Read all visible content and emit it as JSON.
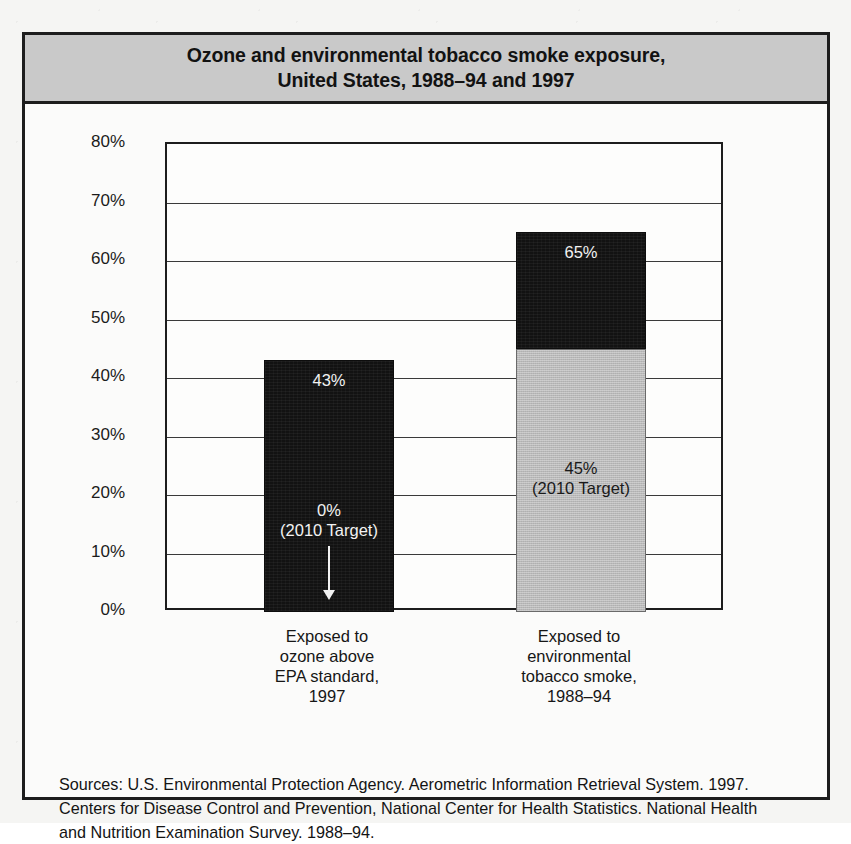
{
  "figure": {
    "title_line1": "Ozone and environmental tobacco smoke exposure,",
    "title_line2": "United States, 1988–94 and 1997",
    "sources_label": "Sources:",
    "sources_line1": "Sources:  U.S. Environmental Protection Agency. Aerometric Information Retrieval System. 1997.",
    "sources_line2": "Centers for Disease Control and Prevention, National Center for Health Statistics. National Health",
    "sources_line3": "and Nutrition Examination Survey. 1988–94.",
    "colors": {
      "title_band": "#c9c9c9",
      "bar_dark": "#121212",
      "bar_gray": "#b9b9b9",
      "frame": "#1d1d1d"
    }
  },
  "chart_data": {
    "type": "bar",
    "subtype": "stacked-with-target",
    "title": "Ozone and environmental tobacco smoke exposure, United States, 1988–94 and 1997",
    "xlabel": "",
    "ylabel": "",
    "ylim": [
      0,
      80
    ],
    "yticks": [
      0,
      10,
      20,
      30,
      40,
      50,
      60,
      70,
      80
    ],
    "ytick_labels": [
      "0%",
      "10%",
      "20%",
      "30%",
      "40%",
      "50%",
      "60%",
      "70%",
      "80%"
    ],
    "grid": true,
    "legend": "none",
    "categories": [
      "Exposed to ozone above EPA standard, 1997",
      "Exposed to environmental tobacco smoke, 1988–94"
    ],
    "category_label_lines": [
      [
        "Exposed to",
        "ozone above",
        "EPA standard,",
        "1997"
      ],
      [
        "Exposed to",
        "environmental",
        "tobacco smoke,",
        "1988–94"
      ]
    ],
    "series": [
      {
        "name": "Current level",
        "values": [
          43,
          65
        ]
      },
      {
        "name": "2010 Target",
        "values": [
          0,
          45
        ]
      }
    ],
    "bars": [
      {
        "category": "Exposed to ozone above EPA standard, 1997",
        "total": 43,
        "total_label": "43%",
        "target": 0,
        "target_label": "0%",
        "target_note": "(2010 Target)",
        "target_has_arrow": true,
        "fill": "dark"
      },
      {
        "category": "Exposed to environmental tobacco smoke, 1988–94",
        "total": 65,
        "total_label": "65%",
        "target": 45,
        "target_label": "45%",
        "target_note": "(2010 Target)",
        "target_has_arrow": false,
        "fill": "dark-over-gray"
      }
    ]
  }
}
